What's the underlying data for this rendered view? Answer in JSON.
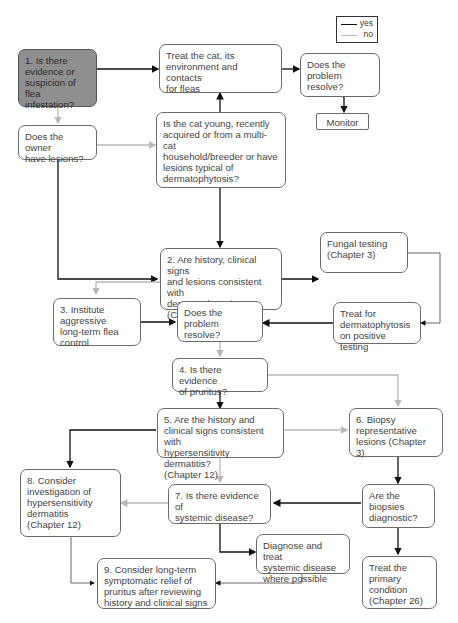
{
  "legend": {
    "yes_label": "yes",
    "no_label": "no",
    "yes_color": "#111111",
    "no_color": "#b8b8b8"
  },
  "nodes": {
    "n1": "1. Is there\nevidence or\nsuspicion of\nflea infestation?",
    "treat_fleas": "Treat the cat, its\nenvironment and contacts\nfor fleas",
    "resolve_top": "Does the\nproblem resolve?",
    "monitor": "Monitor",
    "owner_lesions": "Does the owner\nhave lesions?",
    "cat_young": "Is the cat young, recently\nacquired or from a multi-cat\nhousehold/breeder or have\nlesions typical of\ndermatophytosis?",
    "n2": "2. Are history, clinical signs\nand lesions consistent with\ndermatophytosis?\n(Chapter 11)",
    "fungal": "Fungal testing\n(Chapter 3)",
    "n3": "3. Institute\naggressive\nlong-term flea control",
    "resolve_mid": "Does the problem\nresolve?",
    "treat_derm": "Treat for\ndermatophytosis\non positive testing",
    "n4": "4. Is there evidence\nof pruritus?",
    "n5": "5. Are the history and\nclinical signs consistent with\nhypersensitivity dermatitis?\n(Chapter 12)",
    "n6": "6. Biopsy\nrepresentative\nlesions (Chapter 3)",
    "n8": "8. Consider\ninvestigation of\nhypersensitivity\ndermatitis\n(Chapter 12)",
    "n7": "7. Is there evidence of\nsystemic disease?",
    "biopsies": "Are the\nbiopsies\ndiagnostic?",
    "diag_systemic": "Diagnose and treat\nsystemic disease\nwhere possible",
    "n9": "9. Consider long-term\nsymptomatic relief of\npruritus after reviewing\nhistory and clinical signs",
    "treat_primary": "Treat the\nprimary\ncondition\n(Chapter 26)"
  }
}
